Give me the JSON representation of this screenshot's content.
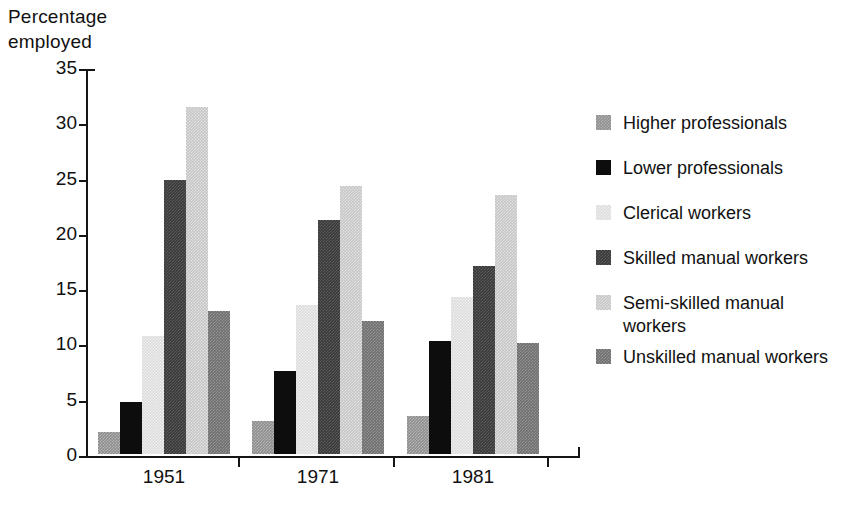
{
  "axis_title": "Percentage\nemployed",
  "y_axis": {
    "ticks": [
      "0",
      "5",
      "10",
      "15",
      "20",
      "25",
      "30",
      "35"
    ],
    "min": 0,
    "max": 35,
    "step": 5
  },
  "x_axis": {
    "labels": [
      "1951",
      "1971",
      "1981"
    ]
  },
  "legend": {
    "items": [
      {
        "label": "Higher professionals",
        "color": "#8e8e8e",
        "swatch": "higher"
      },
      {
        "label": "Lower professionals",
        "color": "#0d0d0d",
        "swatch": "lower"
      },
      {
        "label": "Clerical workers",
        "color": "#dcdcdc",
        "swatch": "clerical"
      },
      {
        "label": "Skilled manual workers",
        "color": "#3a3a3a",
        "swatch": "skilled"
      },
      {
        "label": "Semi-skilled manual workers",
        "color": "#c6c6c6",
        "swatch": "semiskilled"
      },
      {
        "label": "Unskilled manual workers",
        "color": "#6f6f6f",
        "swatch": "unskilled"
      }
    ],
    "line_breaks": {
      "semiskilled_line1": "Semi-skilled manual",
      "semiskilled_line2": "workers"
    }
  },
  "chart_data": {
    "type": "bar",
    "title": "",
    "xlabel": "",
    "ylabel": "Percentage employed",
    "ylim": [
      0,
      35
    ],
    "ytick_step": 5,
    "grid": false,
    "legend_position": "right",
    "categories": [
      "1951",
      "1971",
      "1981"
    ],
    "series": [
      {
        "name": "Higher professionals",
        "color": "#8e8e8e",
        "values": [
          2.0,
          3.0,
          3.4
        ]
      },
      {
        "name": "Lower professionals",
        "color": "#0d0d0d",
        "values": [
          4.7,
          7.5,
          10.2
        ]
      },
      {
        "name": "Clerical workers",
        "color": "#dcdcdc",
        "values": [
          10.7,
          13.5,
          14.2
        ]
      },
      {
        "name": "Skilled manual workers",
        "color": "#3a3a3a",
        "values": [
          24.8,
          21.2,
          17.0
        ]
      },
      {
        "name": "Semi-skilled manual workers",
        "color": "#c6c6c6",
        "values": [
          31.4,
          24.2,
          23.4
        ]
      },
      {
        "name": "Unskilled manual workers",
        "color": "#6f6f6f",
        "values": [
          12.9,
          12.0,
          10.0
        ]
      }
    ]
  }
}
